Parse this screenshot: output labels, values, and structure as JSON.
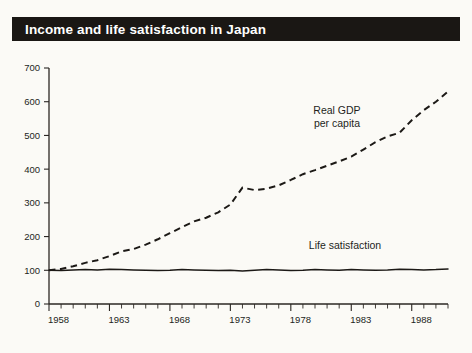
{
  "header": {
    "title": "Income and life satisfaction in Japan"
  },
  "chart_data": {
    "type": "line",
    "title": "Income and life satisfaction in Japan",
    "xlabel": "",
    "ylabel": "",
    "xlim": [
      1958,
      1991
    ],
    "ylim": [
      0,
      700
    ],
    "grid": false,
    "legend_position": "inline-annotation",
    "y_ticks": [
      0,
      100,
      200,
      300,
      400,
      500,
      600,
      700
    ],
    "y_tick_labels": [
      "0",
      "100",
      "200",
      "300",
      "400",
      "500",
      "600",
      "700"
    ],
    "x_tick_labels": [
      "1958",
      "1963",
      "1968",
      "1973",
      "1978",
      "1983",
      "1988"
    ],
    "x_tick_label_years": [
      1958,
      1963,
      1968,
      1973,
      1978,
      1983,
      1988
    ],
    "x_minor_tick_interval": 1,
    "x": [
      1958,
      1959,
      1960,
      1961,
      1962,
      1963,
      1964,
      1965,
      1966,
      1967,
      1968,
      1969,
      1970,
      1971,
      1972,
      1973,
      1974,
      1975,
      1976,
      1977,
      1978,
      1979,
      1980,
      1981,
      1982,
      1983,
      1984,
      1985,
      1986,
      1987,
      1988,
      1989,
      1990,
      1991
    ],
    "series": [
      {
        "name": "Real GDP per capita",
        "style": "dashed",
        "color": "#1c1916",
        "annotation": "Real GDP\nper capita",
        "annotation_lines": [
          "Real GDP",
          "per capita"
        ],
        "values": [
          100,
          104,
          112,
          122,
          130,
          142,
          156,
          163,
          176,
          192,
          210,
          228,
          245,
          256,
          272,
          295,
          345,
          338,
          342,
          352,
          368,
          385,
          397,
          410,
          423,
          437,
          458,
          480,
          497,
          508,
          545,
          575,
          600,
          630
        ]
      },
      {
        "name": "Life satisfaction",
        "style": "solid",
        "color": "#1c1916",
        "annotation": "Life satisfaction",
        "annotation_lines": [
          "Life satisfaction"
        ],
        "values": [
          100,
          99,
          101,
          102,
          101,
          103,
          102,
          101,
          100,
          99,
          100,
          102,
          101,
          100,
          99,
          100,
          98,
          100,
          102,
          101,
          99,
          100,
          102,
          101,
          100,
          102,
          101,
          100,
          101,
          103,
          102,
          101,
          102,
          104
        ]
      }
    ],
    "annotations": [
      {
        "text": "Real GDP",
        "x_px": 337,
        "y_px": 114
      },
      {
        "text": "per capita",
        "x_px": 337,
        "y_px": 127
      },
      {
        "text": "Life satisfaction",
        "x_px": 345,
        "y_px": 249
      }
    ]
  },
  "colors": {
    "background": "#fbfaf6",
    "title_bar": "#1a1714",
    "title_text": "#ffffff",
    "ink": "#1c1916"
  }
}
